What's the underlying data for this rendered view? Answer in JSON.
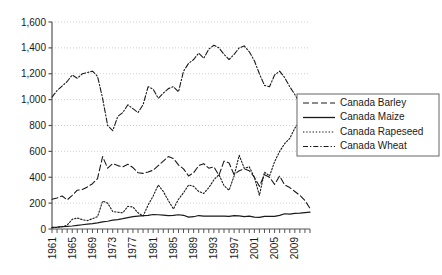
{
  "chart_data": {
    "type": "line",
    "title": "",
    "subtitle": "",
    "xlabel": "",
    "ylabel": "",
    "xlim": [
      1961,
      2012
    ],
    "ylim": [
      0,
      1600
    ],
    "grid": true,
    "grid_axis": "y",
    "legend_position": "right",
    "ytick_labels": [
      "0",
      "200",
      "400",
      "600",
      "800",
      "1,000",
      "1,200",
      "1,400",
      "1,600"
    ],
    "ytick_values": [
      0,
      200,
      400,
      600,
      800,
      1000,
      1200,
      1400,
      1600
    ],
    "xtick_labels": [
      "1961",
      "1965",
      "1969",
      "1973",
      "1977",
      "1981",
      "1985",
      "1989",
      "1993",
      "1997",
      "2001",
      "2005",
      "2009"
    ],
    "xtick_values": [
      1961,
      1965,
      1969,
      1973,
      1977,
      1981,
      1985,
      1989,
      1993,
      1997,
      2001,
      2005,
      2009
    ],
    "x": [
      1961,
      1962,
      1963,
      1964,
      1965,
      1966,
      1967,
      1968,
      1969,
      1970,
      1971,
      1972,
      1973,
      1974,
      1975,
      1976,
      1977,
      1978,
      1979,
      1980,
      1981,
      1982,
      1983,
      1984,
      1985,
      1986,
      1987,
      1988,
      1989,
      1990,
      1991,
      1992,
      1993,
      1994,
      1995,
      1996,
      1997,
      1998,
      1999,
      2000,
      2001,
      2002,
      2003,
      2004,
      2005,
      2006,
      2007,
      2008,
      2009,
      2010,
      2011,
      2012
    ],
    "series": [
      {
        "name": "Canada Barley",
        "style": "dashed",
        "color": "#1a1a1a",
        "values": [
          230,
          240,
          255,
          225,
          260,
          300,
          305,
          325,
          350,
          390,
          560,
          470,
          505,
          490,
          480,
          500,
          475,
          435,
          430,
          440,
          455,
          490,
          525,
          560,
          545,
          495,
          465,
          410,
          435,
          490,
          505,
          470,
          480,
          415,
          525,
          510,
          420,
          450,
          465,
          450,
          400,
          330,
          420,
          400,
          345,
          410,
          340,
          320,
          290,
          260,
          220,
          160
        ]
      },
      {
        "name": "Canada Maize",
        "style": "solid",
        "color": "#1a1a1a",
        "values": [
          12,
          14,
          18,
          20,
          23,
          28,
          33,
          38,
          42,
          47,
          55,
          60,
          68,
          73,
          80,
          88,
          95,
          100,
          103,
          105,
          112,
          110,
          107,
          104,
          105,
          110,
          106,
          92,
          95,
          104,
          100,
          100,
          99,
          100,
          100,
          98,
          104,
          102,
          96,
          100,
          92,
          90,
          98,
          97,
          98,
          105,
          118,
          115,
          120,
          123,
          127,
          130
        ]
      },
      {
        "name": "Canada Rapeseed",
        "style": "dotted",
        "color": "#1a1a1a",
        "values": [
          10,
          12,
          18,
          30,
          75,
          85,
          72,
          65,
          80,
          95,
          215,
          200,
          135,
          130,
          125,
          175,
          170,
          125,
          100,
          185,
          255,
          340,
          290,
          220,
          155,
          230,
          280,
          340,
          330,
          290,
          275,
          320,
          380,
          420,
          335,
          300,
          410,
          570,
          470,
          480,
          400,
          260,
          440,
          410,
          520,
          600,
          660,
          700,
          780,
          830,
          930,
          1000
        ]
      },
      {
        "name": "Canada Wheat",
        "style": "dashdot",
        "color": "#1a1a1a",
        "values": [
          1020,
          1070,
          1105,
          1140,
          1190,
          1165,
          1200,
          1210,
          1220,
          1180,
          1010,
          800,
          760,
          870,
          900,
          960,
          930,
          900,
          960,
          1100,
          1080,
          1010,
          1050,
          1085,
          1100,
          1060,
          1220,
          1280,
          1310,
          1360,
          1320,
          1390,
          1420,
          1400,
          1350,
          1310,
          1350,
          1400,
          1415,
          1370,
          1300,
          1200,
          1110,
          1100,
          1190,
          1220,
          1170,
          1100,
          1040,
          970,
          890,
          1000
        ]
      }
    ]
  },
  "legend": {
    "items": [
      {
        "label": "Canada Barley",
        "style": "dashed"
      },
      {
        "label": "Canada Maize",
        "style": "solid"
      },
      {
        "label": "Canada Rapeseed",
        "style": "dotted"
      },
      {
        "label": "Canada Wheat",
        "style": "dashdot"
      }
    ]
  }
}
